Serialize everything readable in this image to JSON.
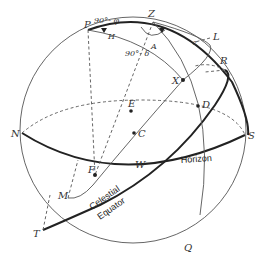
{
  "diagram": {
    "points": {
      "P": "P",
      "Z": "Z",
      "L": "L",
      "R": "R",
      "X": "X",
      "D": "D",
      "E": "E",
      "C": "C",
      "N": "N",
      "S": "S",
      "F": "F",
      "W": "W",
      "M": "M",
      "T": "T",
      "Q": "Q"
    },
    "arc_labels": {
      "colatitude": "90°- φ",
      "codeclination": "90°- δ",
      "hour_angle": "H",
      "azimuth": "A",
      "zenith_distance": "z"
    },
    "circle_labels": {
      "horizon": "Horizon",
      "equator_line1": "Celestial",
      "equator_line2": "Equator"
    }
  }
}
